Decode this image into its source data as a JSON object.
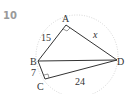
{
  "problem_number": "10",
  "diagram": {
    "vertices": {
      "A": "A",
      "B": "B",
      "C": "C",
      "D": "D"
    },
    "edges": {
      "AB": "15",
      "BC": "7",
      "CD": "24",
      "AD": "x"
    },
    "right_angles": [
      "A",
      "C"
    ],
    "circle": "circumscribed (dotted)"
  }
}
